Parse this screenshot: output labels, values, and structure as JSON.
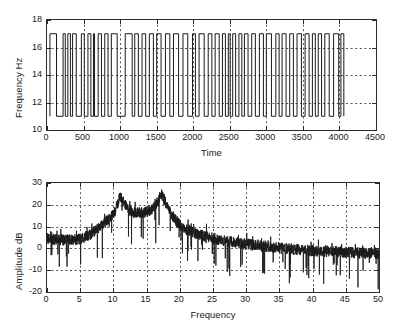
{
  "figure": {
    "background": "#ffffff",
    "line_color": "#1a1a1a",
    "grid_color": "#555555",
    "axis_color": "#2b2b2b"
  },
  "chart_data": [
    {
      "id": "fsk-time-plot",
      "type": "line",
      "title": "",
      "xlabel": "Time",
      "ylabel": "Frequency Hz",
      "xlim": [
        0,
        4500
      ],
      "ylim": [
        10,
        18
      ],
      "xticks": [
        0,
        500,
        1000,
        1500,
        2000,
        2500,
        3000,
        3500,
        4000,
        4500
      ],
      "xticklabels": [
        "0",
        "500",
        "1000",
        "1500",
        "2000",
        "2500",
        "3000",
        "3500",
        "4000",
        "4500"
      ],
      "yticks": [
        10,
        12,
        14,
        16,
        18
      ],
      "yticklabels": [
        "10",
        "12",
        "14",
        "16",
        "18"
      ],
      "grid": true,
      "grid_style": "dashed",
      "legend": "none",
      "description": "Binary FSK instantaneous frequency: square wave alternating between 11 Hz and 17 Hz",
      "low_level": 11,
      "high_level": 17,
      "signal_start": 40,
      "signal_end": 4060,
      "symbol_edges": [
        40,
        130,
        220,
        250,
        285,
        320,
        350,
        400,
        470,
        510,
        560,
        600,
        635,
        650,
        700,
        745,
        790,
        835,
        880,
        960,
        1070,
        1165,
        1200,
        1250,
        1300,
        1350,
        1400,
        1455,
        1500,
        1560,
        1620,
        1680,
        1730,
        1800,
        1860,
        1925,
        1990,
        2030,
        2080,
        2150,
        2205,
        2255,
        2300,
        2355,
        2400,
        2440,
        2480,
        2505,
        2540,
        2580,
        2625,
        2665,
        2700,
        2750,
        2800,
        2850,
        2905,
        2960,
        3000,
        3070,
        3130,
        3175,
        3215,
        3270,
        3320,
        3370,
        3420,
        3480,
        3530,
        3585,
        3630,
        3670,
        3710,
        3755,
        3800,
        3860,
        3920,
        3990,
        4020,
        4060
      ],
      "first_state": "high"
    },
    {
      "id": "amplitude-spectrum-plot",
      "type": "line",
      "title": "",
      "xlabel": "Frequency",
      "ylabel": "Amplitude dB",
      "xlim": [
        0,
        50
      ],
      "ylim": [
        -20,
        30
      ],
      "xticks": [
        0,
        5,
        10,
        15,
        20,
        25,
        30,
        35,
        40,
        45,
        50
      ],
      "xticklabels": [
        "0",
        "5",
        "10",
        "15",
        "20",
        "25",
        "30",
        "35",
        "40",
        "45",
        "50"
      ],
      "yticks": [
        -20,
        -10,
        0,
        10,
        20,
        30
      ],
      "yticklabels": [
        "-20",
        "-10",
        "0",
        "10",
        "20",
        "30"
      ],
      "grid": true,
      "grid_style": "dashed",
      "legend": "none",
      "description": "Noisy amplitude spectrum in dB with two dominant peaks at the FSK tone frequencies",
      "noise_amplitude_db": 6,
      "peaks": [
        {
          "frequency": 11.0,
          "amplitude_db": 24.0,
          "width": 1.6
        },
        {
          "frequency": 17.2,
          "amplitude_db": 25.5,
          "width": 1.4
        }
      ],
      "envelope": [
        {
          "x": 0,
          "y": 4
        },
        {
          "x": 2,
          "y": 3.5
        },
        {
          "x": 4,
          "y": 3.5
        },
        {
          "x": 5,
          "y": 4
        },
        {
          "x": 6,
          "y": 5
        },
        {
          "x": 7,
          "y": 7
        },
        {
          "x": 8,
          "y": 9.5
        },
        {
          "x": 9,
          "y": 12
        },
        {
          "x": 10,
          "y": 15
        },
        {
          "x": 10.6,
          "y": 19
        },
        {
          "x": 11,
          "y": 23
        },
        {
          "x": 11.6,
          "y": 20
        },
        {
          "x": 12.5,
          "y": 16.5
        },
        {
          "x": 13.5,
          "y": 16
        },
        {
          "x": 14.5,
          "y": 16
        },
        {
          "x": 15.5,
          "y": 17
        },
        {
          "x": 16.4,
          "y": 19
        },
        {
          "x": 17.2,
          "y": 24
        },
        {
          "x": 17.9,
          "y": 20
        },
        {
          "x": 18.6,
          "y": 16
        },
        {
          "x": 19.5,
          "y": 12
        },
        {
          "x": 20.5,
          "y": 9
        },
        {
          "x": 22,
          "y": 7
        },
        {
          "x": 24,
          "y": 5
        },
        {
          "x": 26,
          "y": 3.5
        },
        {
          "x": 28,
          "y": 2.5
        },
        {
          "x": 30,
          "y": 1.5
        },
        {
          "x": 33,
          "y": 0.5
        },
        {
          "x": 36,
          "y": -0.5
        },
        {
          "x": 40,
          "y": -1.5
        },
        {
          "x": 44,
          "y": -2
        },
        {
          "x": 47,
          "y": -2.5
        },
        {
          "x": 50,
          "y": -3
        }
      ]
    }
  ]
}
